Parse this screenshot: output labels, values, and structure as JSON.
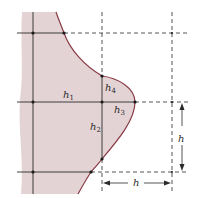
{
  "diagram": {
    "colors": {
      "region_fill": "#e3d3d5",
      "boundary": "#8a3a44",
      "grid_line": "#2a2a2a"
    },
    "grid_spacing_label": "h",
    "labels": {
      "h1": {
        "base": "h",
        "sub": "1"
      },
      "h2": {
        "base": "h",
        "sub": "2"
      },
      "h3": {
        "base": "h",
        "sub": "3"
      },
      "h4": {
        "base": "h",
        "sub": "4"
      }
    },
    "dimensions": {
      "vertical": {
        "label": "h"
      },
      "horizontal": {
        "label": "h"
      }
    }
  }
}
